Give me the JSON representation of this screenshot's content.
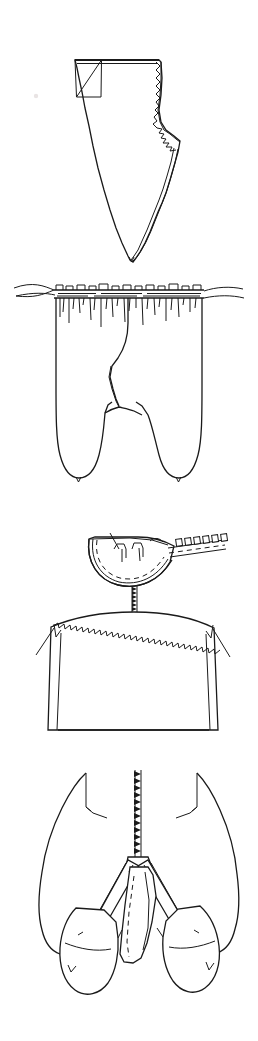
{
  "sheet": {
    "title": "Garment Construction Line Drawings",
    "width_px": 258,
    "height_px": 1041,
    "background_color": "#ffffff",
    "ink_color": "#1a1a1a",
    "style": "black and white technical line art, hand-drawn sewing illustration",
    "figure_count": 4
  },
  "figures": [
    {
      "id": "figure-1",
      "name": "trouser-front-pattern-piece",
      "caption": "",
      "description": "Flat trouser front pattern piece with straight top edge, folded-back corner at upper left, pinked zigzag seam allowance along the right curved edge, and a long tapering inseam ending in a point at the bottom.",
      "details": [
        "folded-corner-triangle",
        "pinked-zigzag-edge",
        "curved-crotch-seam",
        "double-stitch-line"
      ]
    },
    {
      "id": "figure-2",
      "name": "gathered-waistband-trousers",
      "caption": "",
      "description": "Pair of trousers viewed flat with a heavily gathered and shirred waistband at the top, vertical gather folds falling from the waist, and two rounded leg hems with small center notches.",
      "details": [
        "gathered-waistband",
        "drawstring-casing",
        "gather-fold-lines",
        "rounded-leg-hem",
        "hem-notch"
      ]
    },
    {
      "id": "figure-3",
      "name": "collar-and-shoulder-seam",
      "caption": "",
      "description": "Curved collar or neckline facing shown above a bodice yoke. Pinked zigzag seam allowance runs along the shoulder line and a short vertical zipper joins the collar to the neckline. A zipper tape with square teeth extends to the upper right.",
      "details": [
        "curved-collar-piece",
        "dashed-stitch-line",
        "zipper-tape",
        "zipper-teeth",
        "center-back-zipper",
        "pinked-shoulder-seam",
        "shoulder-notch"
      ]
    },
    {
      "id": "figure-4",
      "name": "crotch-gusset-with-zipper",
      "caption": "",
      "description": "Underside crotch and gusset construction of trousers showing a long vertical zipper running down the center seam, pinked seam allowances opening into a V, and two overlapping rounded leg sections with dashed topstitching.",
      "details": [
        "center-zipper",
        "zipper-teeth",
        "pinked-seam-allowance",
        "gusset-panel",
        "dashed-topstitching",
        "rounded-leg-end",
        "hem-notch"
      ]
    }
  ]
}
